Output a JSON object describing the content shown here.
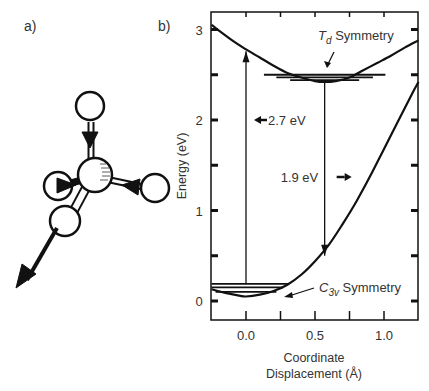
{
  "panels": {
    "a_label": "a)",
    "b_label": "b)"
  },
  "molecule": {
    "description": "Tetrahedral molecule with central atom, four ligand atoms and displacement arrows"
  },
  "chart_data": {
    "type": "line",
    "title": "",
    "xlabel_line1": "Coordinate",
    "xlabel_line2": "Displacement (Å)",
    "ylabel": "Energy (eV)",
    "xlim": [
      -0.25,
      1.25
    ],
    "ylim": [
      -0.2,
      3.2
    ],
    "xticks": [
      0.0,
      0.5,
      1.0
    ],
    "xtick_labels": [
      "0.0",
      "0.5",
      "1.0"
    ],
    "xminor_ticks": [
      -0.25,
      0.0,
      0.25,
      0.5,
      0.75,
      1.0,
      1.25
    ],
    "yticks": [
      0,
      1,
      2,
      3
    ],
    "ytick_labels": [
      "0",
      "1",
      "2",
      "3"
    ],
    "yminor_ticks": [
      0.5,
      1.5,
      2.5
    ],
    "grid": false,
    "series": [
      {
        "name": "Upper state (Td)",
        "x": [
          -0.25,
          -0.1,
          0.0,
          0.1,
          0.2,
          0.3,
          0.4,
          0.5,
          0.57,
          0.65,
          0.75,
          0.85,
          0.95,
          1.05,
          1.15,
          1.25
        ],
        "y": [
          3.05,
          2.88,
          2.78,
          2.69,
          2.6,
          2.52,
          2.47,
          2.43,
          2.42,
          2.43,
          2.47,
          2.55,
          2.63,
          2.71,
          2.8,
          2.88
        ]
      },
      {
        "name": "Lower state (C3v)",
        "x": [
          -0.25,
          -0.15,
          -0.05,
          0.0,
          0.1,
          0.2,
          0.3,
          0.4,
          0.5,
          0.6,
          0.7,
          0.8,
          0.9,
          1.0,
          1.1,
          1.2,
          1.25
        ],
        "y": [
          0.13,
          0.09,
          0.06,
          0.05,
          0.07,
          0.11,
          0.18,
          0.29,
          0.44,
          0.62,
          0.85,
          1.1,
          1.38,
          1.68,
          1.98,
          2.28,
          2.42
        ]
      }
    ],
    "vibrational_levels": [
      {
        "state": "upper",
        "energies": [
          2.44,
          2.47,
          2.5
        ]
      },
      {
        "state": "lower",
        "energies": [
          0.1,
          0.15,
          0.19
        ]
      }
    ],
    "transitions": [
      {
        "label": "2.7 eV",
        "x": 0.0,
        "from": 0.19,
        "to": 2.76,
        "direction": "up"
      },
      {
        "label": "1.9 eV",
        "x": 0.57,
        "from": 2.42,
        "to": 0.5,
        "direction": "down"
      }
    ],
    "annotations": [
      {
        "text_main": "T",
        "text_sub": "d",
        "text_rest": " Symmetry"
      },
      {
        "text_main": "C",
        "text_sub": "3v",
        "text_rest": " Symmetry"
      }
    ]
  }
}
